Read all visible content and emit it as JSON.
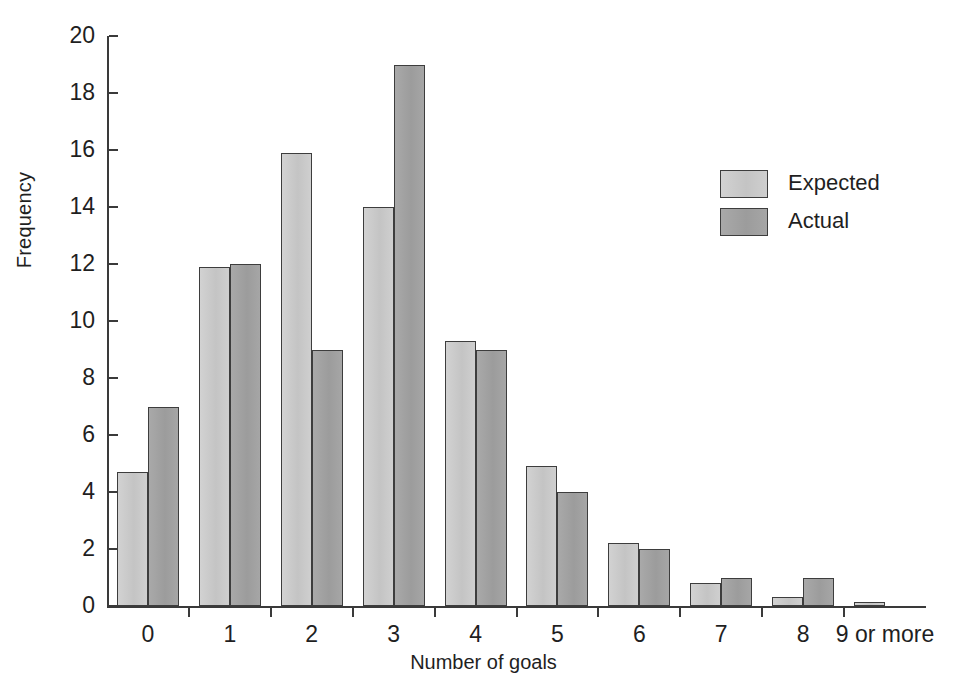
{
  "chart_data": {
    "type": "bar",
    "title": "",
    "subtitle": "",
    "xlabel": "Number of goals",
    "ylabel": "Frequency",
    "categories": [
      "0",
      "1",
      "2",
      "3",
      "4",
      "5",
      "6",
      "7",
      "8",
      "9 or more"
    ],
    "series": [
      {
        "name": "Expected",
        "color": "#c9c9c9",
        "values": [
          4.7,
          11.9,
          15.9,
          14.0,
          9.3,
          4.9,
          2.2,
          0.8,
          0.3,
          0.15
        ]
      },
      {
        "name": "Actual",
        "color": "#a2a2a2",
        "values": [
          7,
          12,
          9,
          19,
          9,
          4,
          2,
          1,
          1,
          0
        ]
      }
    ],
    "ylim": [
      0,
      20
    ],
    "ytick_step": 2,
    "ytick_labels": [
      "0",
      "2",
      "4",
      "6",
      "8",
      "10",
      "12",
      "14",
      "16",
      "18",
      "20"
    ],
    "grid": false,
    "legend_position": "top-right",
    "annotations": []
  },
  "legend": {
    "entries": [
      {
        "label": "Expected"
      },
      {
        "label": "Actual"
      }
    ]
  },
  "axes": {
    "x_title": "Number of goals",
    "y_title": "Frequency"
  }
}
